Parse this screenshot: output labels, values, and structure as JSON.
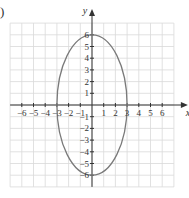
{
  "part_label": ")",
  "chart_data": {
    "type": "line",
    "title": "",
    "xlabel": "x",
    "ylabel": "y",
    "xlim": [
      -7,
      7
    ],
    "ylim": [
      -7,
      7
    ],
    "grid": true,
    "x_ticks": [
      -6,
      -5,
      -4,
      -3,
      -2,
      -1,
      1,
      2,
      3,
      4,
      5,
      6
    ],
    "y_ticks": [
      -6,
      -5,
      -4,
      -3,
      -2,
      -1,
      1,
      2,
      3,
      4,
      5,
      6
    ],
    "x_tick_labels": [
      "−6",
      "−5",
      "−4",
      "−3",
      "−2",
      "−1",
      "1",
      "2",
      "3",
      "4",
      "5",
      "6"
    ],
    "y_tick_labels": [
      "−6",
      "−5",
      "−4",
      "−3",
      "−2",
      "−1",
      "1",
      "2",
      "3",
      "4",
      "5",
      "6"
    ],
    "series": [
      {
        "name": "ellipse",
        "shape": "ellipse",
        "center": [
          0,
          0
        ],
        "semi_axis_x": 3,
        "semi_axis_y": 6,
        "equation": "x^2/9 + y^2/36 = 1",
        "color": "#7a7a7a"
      }
    ]
  },
  "colors": {
    "grid": "#d9d9d9",
    "axis": "#333333",
    "curve": "#7a7a7a",
    "text": "#333333"
  }
}
